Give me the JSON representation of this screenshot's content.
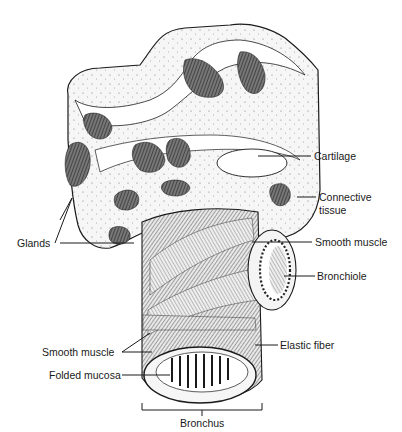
{
  "diagram": {
    "colors": {
      "ink": "#1a1a1a",
      "background": "#ffffff",
      "tissue_fill": "#f2f2f2",
      "gland_fill": "#555555"
    },
    "labels": {
      "cartilage": "Cartilage",
      "connective_tissue_line1": "Connective",
      "connective_tissue_line2": "tissue",
      "glands": "Glands",
      "smooth_muscle_right": "Smooth muscle",
      "bronchiole": "Bronchiole",
      "smooth_muscle_left": "Smooth muscle",
      "elastic_fiber": "Elastic fiber",
      "folded_mucosa": "Folded mucosa",
      "bronchus": "Bronchus"
    }
  }
}
